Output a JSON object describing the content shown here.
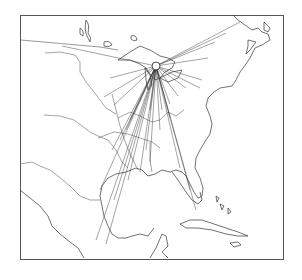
{
  "map": {
    "type": "flow-map",
    "region": "Eastern North America",
    "hub": {
      "x": 156,
      "y": 66
    },
    "flow_line_color": "#333333",
    "coastline_color": "#333333",
    "frame_color": "#555555",
    "flow_targets": [
      [
        62,
        46
      ],
      [
        110,
        78
      ],
      [
        104,
        97
      ],
      [
        114,
        105
      ],
      [
        240,
        22
      ],
      [
        226,
        33
      ],
      [
        215,
        42
      ],
      [
        208,
        58
      ],
      [
        202,
        80
      ],
      [
        200,
        88
      ],
      [
        186,
        88
      ],
      [
        178,
        96
      ],
      [
        170,
        104
      ],
      [
        162,
        110
      ],
      [
        150,
        110
      ],
      [
        130,
        120
      ],
      [
        126,
        130
      ],
      [
        120,
        140
      ],
      [
        112,
        150
      ],
      [
        100,
        190
      ],
      [
        96,
        240
      ],
      [
        106,
        244
      ],
      [
        114,
        200
      ],
      [
        128,
        180
      ],
      [
        140,
        172
      ],
      [
        146,
        150
      ],
      [
        150,
        162
      ],
      [
        180,
        168
      ],
      [
        190,
        190
      ],
      [
        196,
        210
      ],
      [
        160,
        130
      ],
      [
        170,
        118
      ]
    ]
  }
}
